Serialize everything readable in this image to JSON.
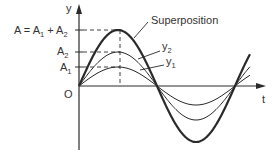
{
  "diagram": {
    "axes": {
      "y_label": "y",
      "x_label": "t",
      "origin_label": "O"
    },
    "amplitude_labels": {
      "total": {
        "main": "A = A",
        "sub1": "1",
        "plus": " + A",
        "sub2": "2"
      },
      "a2": {
        "main": "A",
        "sub": "2"
      },
      "a1": {
        "main": "A",
        "sub": "1"
      }
    },
    "curve_labels": {
      "superposition": "Superposition",
      "y2": {
        "main": "y",
        "sub": "2"
      },
      "y1": {
        "main": "y",
        "sub": "1"
      }
    },
    "curves": [
      {
        "name": "y1",
        "amplitude": 19,
        "stroke_width": 1
      },
      {
        "name": "y2",
        "amplitude": 34,
        "stroke_width": 1
      },
      {
        "name": "superposition",
        "amplitude": 56,
        "stroke_width": 2.2
      }
    ],
    "colors": {
      "line": "#2a2a2a",
      "text": "#333333",
      "background": "#ffffff"
    }
  }
}
